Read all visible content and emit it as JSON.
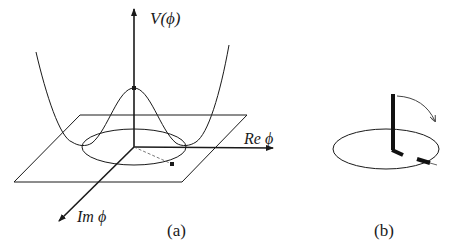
{
  "figure": {
    "panel_a": {
      "caption": "(a)",
      "axis_vertical_label": "V(ϕ)",
      "axis_real_label": "Re ϕ",
      "axis_imag_label": "Im ϕ",
      "description": "Mexican-hat potential V(ϕ) over the complex ϕ plane, with the vacuum circle and a point on it"
    },
    "panel_b": {
      "caption": "(b)",
      "description": "Order-parameter vector rotating from vertical onto the vacuum circle"
    },
    "colors": {
      "ink": "#1a1a1a",
      "background": "#ffffff"
    }
  }
}
